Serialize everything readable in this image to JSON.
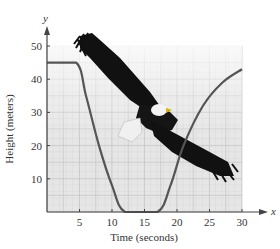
{
  "chart_data": {
    "type": "line",
    "title": "",
    "xlabel": "Time (seconds)",
    "ylabel": "Height (meters)",
    "x_axis_var": "x",
    "y_axis_var": "y",
    "xlim": [
      0,
      30
    ],
    "ylim": [
      0,
      55
    ],
    "x_ticks": [
      5,
      10,
      15,
      20,
      25,
      30
    ],
    "y_ticks": [
      10,
      20,
      30,
      40,
      50
    ],
    "x_tick_labels": [
      "5",
      "10",
      "15",
      "20",
      "25",
      "30"
    ],
    "y_tick_labels": [
      "10",
      "20",
      "30",
      "40",
      "50"
    ],
    "grid": true,
    "legend": null,
    "series": [
      {
        "name": "Eagle height",
        "color": "#555555",
        "x": [
          0,
          4.5,
          6,
          8,
          10,
          12,
          17,
          19,
          21,
          24,
          27,
          30
        ],
        "y": [
          45,
          45,
          35,
          20,
          8,
          0,
          0,
          8,
          20,
          32,
          39,
          43
        ]
      }
    ],
    "annotations": [
      "Illustration of a bald eagle in flight overlaid on the graph"
    ]
  },
  "colors": {
    "grid_bg": "#e4e4e4",
    "grid_line": "#cfcfcf",
    "axis": "#444444",
    "curve": "#555555"
  }
}
